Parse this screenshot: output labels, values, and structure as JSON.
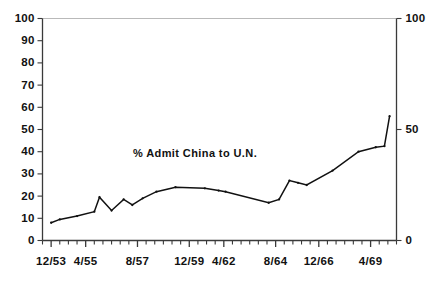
{
  "chart_data": {
    "type": "line",
    "title": "",
    "annotation": "% Admit China to U.N.",
    "xlabel": "",
    "ylabel": "",
    "ylim": [
      0,
      100
    ],
    "grid": false,
    "legend": "none",
    "left_axis": {
      "ticks": [
        0,
        10,
        20,
        30,
        40,
        50,
        60,
        70,
        80,
        90,
        100
      ],
      "tick_labels": [
        "0",
        "10",
        "20",
        "30",
        "40",
        "50",
        "60",
        "70",
        "80",
        "90",
        "100"
      ]
    },
    "right_axis": {
      "ticks": [
        0,
        50,
        100
      ],
      "tick_labels": [
        "0",
        "50",
        "100"
      ]
    },
    "x_tick_labels": [
      "12/53",
      "4/55",
      "8/57",
      "12/59",
      "4/62",
      "8/64",
      "12/66",
      "4/69"
    ],
    "x_tick_positions": [
      1,
      5,
      11,
      17,
      21,
      27,
      32,
      38
    ],
    "x_minor_count": 41,
    "series": [
      {
        "name": "% Admit China to U.N.",
        "color": "#111111",
        "x": [
          1,
          2,
          4,
          6,
          6.6,
          8,
          9.4,
          10.4,
          11.6,
          13.2,
          15.4,
          18.8,
          20.4,
          21.2,
          26.2,
          27.4,
          28.6,
          29.6,
          30.6,
          33.6,
          36.6,
          38.6,
          39.6,
          40.2
        ],
        "values": [
          8,
          9.5,
          11,
          13,
          19.5,
          13.5,
          18.5,
          16,
          19,
          22,
          24,
          23.5,
          22.5,
          22,
          17,
          18.5,
          27,
          26,
          25,
          31.5,
          40,
          42,
          42.5,
          56
        ]
      }
    ]
  },
  "colors": {
    "axis": "#3a3a3a",
    "axis_top": "#b9b9b9",
    "line": "#111111",
    "text": "#111111",
    "background": "#ffffff"
  }
}
